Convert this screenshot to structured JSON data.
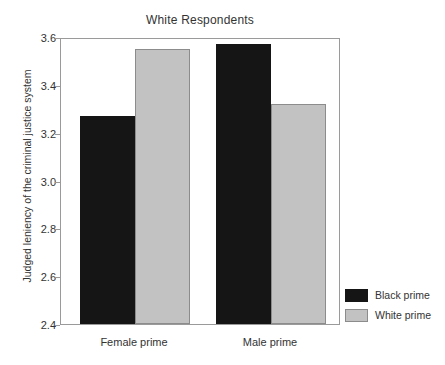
{
  "chart_data": {
    "type": "bar",
    "title": "White Respondents",
    "xlabel": "",
    "ylabel": "Judged leniency of the criminal justice system",
    "categories": [
      "Female prime",
      "Male prime"
    ],
    "series": [
      {
        "name": "Black prime",
        "color": "#151515",
        "values": [
          3.27,
          3.57
        ]
      },
      {
        "name": "White prime",
        "color": "#c2c2c2",
        "values": [
          3.55,
          3.32
        ]
      }
    ],
    "ylim": [
      2.4,
      3.6
    ],
    "yticks": [
      "2.4",
      "2.6",
      "2.8",
      "3.0",
      "3.2",
      "3.4",
      "3.6"
    ],
    "ytick_values": [
      2.4,
      2.6,
      2.8,
      3.0,
      3.2,
      3.4,
      3.6
    ],
    "grid": false,
    "legend_position": "right-bottom"
  },
  "legend": {
    "entries": [
      {
        "label": "Black prime"
      },
      {
        "label": "White prime"
      }
    ]
  }
}
